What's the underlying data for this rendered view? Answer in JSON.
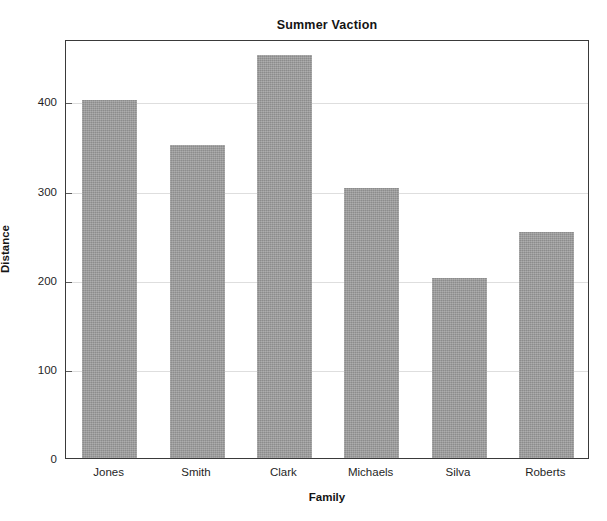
{
  "chart_data": {
    "type": "bar",
    "title": "Summer Vaction",
    "xlabel": "Family",
    "ylabel": "Distance",
    "categories": [
      "Jones",
      "Smith",
      "Clark",
      "Michaels",
      "Silva",
      "Roberts"
    ],
    "values": [
      402,
      351,
      452,
      303,
      202,
      254
    ],
    "ylim": [
      0,
      470
    ],
    "yticks": [
      0,
      100,
      200,
      300,
      400
    ],
    "ytick_labels": [
      "0",
      "100",
      "200",
      "300",
      "400"
    ],
    "grid": true,
    "grid_axis": "y",
    "legend": false,
    "bar_color": "#9a9a9a",
    "frame_color": "#3a3a3a",
    "grid_color": "#dedede",
    "background_color": "#ffffff"
  }
}
